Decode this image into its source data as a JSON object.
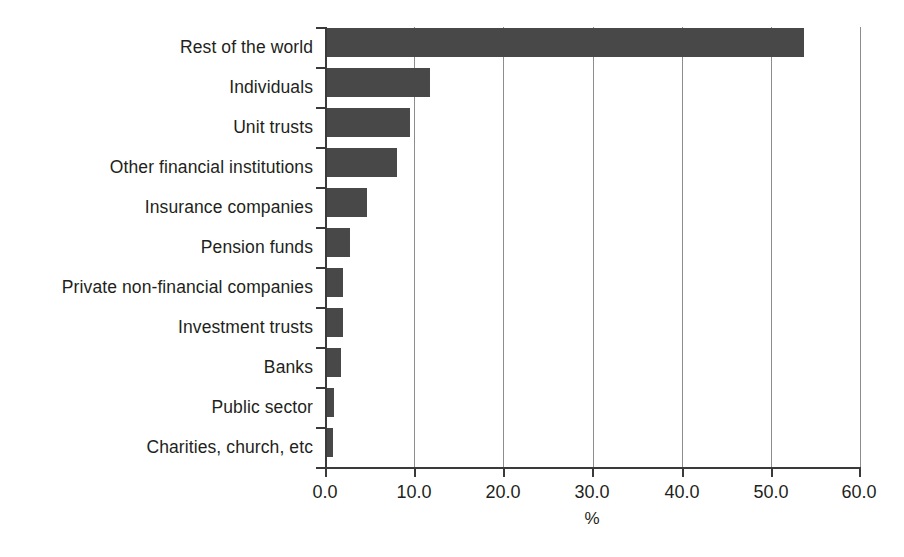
{
  "chart_data": {
    "type": "bar",
    "orientation": "horizontal",
    "title": "",
    "subtitle": "",
    "xlabel": "%",
    "ylabel": "",
    "xlim": [
      0.0,
      60.0
    ],
    "xticks": [
      "0.0",
      "10.0",
      "20.0",
      "30.0",
      "40.0",
      "50.0",
      "60.0"
    ],
    "xtick_values": [
      0,
      10,
      20,
      30,
      40,
      50,
      60
    ],
    "grid": "vertical",
    "legend": "none",
    "bar_color": "#484848",
    "categories": [
      "Rest of the world",
      "Individuals",
      "Unit trusts",
      "Other financial institutions",
      "Insurance companies",
      "Pension funds",
      "Private non-financial companies",
      "Investment trusts",
      "Banks",
      "Public sector",
      "Charities, church, etc"
    ],
    "values": [
      53.7,
      11.8,
      9.5,
      8.1,
      4.7,
      2.8,
      2.0,
      2.0,
      1.8,
      1.0,
      0.9
    ],
    "annotations": []
  }
}
